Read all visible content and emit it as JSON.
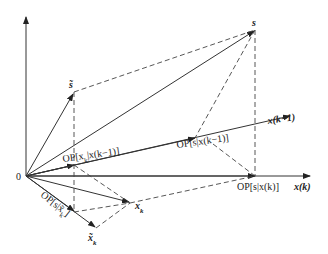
{
  "diagram": {
    "type": "vector-projection",
    "colors": {
      "line": "#333333",
      "background": "#ffffff"
    },
    "points": {
      "origin": {
        "label": "0",
        "x": 26,
        "y": 176
      },
      "vertical_axis_top": {
        "x": 26,
        "y": 16
      },
      "xk_axis_tip": {
        "label": "x(k)",
        "x": 310,
        "y": 176
      },
      "s": {
        "label": "s",
        "x": 255,
        "y": 30
      },
      "s_tilde": {
        "label": "s̃",
        "x": 74,
        "y": 92
      },
      "x_k_minus_1": {
        "label": "x(k−1)",
        "x": 290,
        "y": 116
      },
      "op_s_xk1": {
        "label": "OP[s|x(k−1)]",
        "x": 195,
        "y": 135
      },
      "op_s_xk": {
        "label": "OP[s|x(k)]",
        "x": 255,
        "y": 176
      },
      "op_xk_xk1": {
        "label": "OP[x_k|x(k−1)]",
        "x": 74,
        "y": 157
      },
      "x_k": {
        "label": "x_k",
        "x": 130,
        "y": 203
      },
      "x_k_tilde": {
        "label": "x̃_k",
        "x": 96,
        "y": 228
      },
      "op_s_xktilde": {
        "label": "OP[s|x̃_k]",
        "x": 74,
        "y": 212
      }
    },
    "labels": {
      "origin": "0",
      "s": "s",
      "s_tilde": "s̃",
      "x_k_minus_1": "x(k−1)",
      "x_k_axis": "x(k)",
      "op_s_xk1": "OP[s|x(k−1)]",
      "op_s_xk": "OP[s|x(k)]",
      "op_xk_xk1": "OP[x",
      "op_xk_xk1_sub": "k",
      "op_xk_xk1_tail": "|x(k−1)]",
      "op_s_xktilde": "OP[s|x̃",
      "op_s_xktilde_sub": "k",
      "op_s_xktilde_tail": "]",
      "x_k": "x",
      "x_k_sub": "k",
      "x_k_tilde": "x̃",
      "x_k_tilde_sub": "k"
    }
  }
}
